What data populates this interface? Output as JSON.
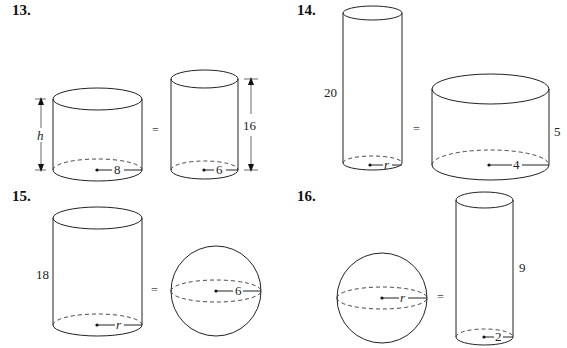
{
  "problems": [
    {
      "number": "13.",
      "left": {
        "shape": "cylinder",
        "height_label": "h",
        "radius_label": "8"
      },
      "equals": "=",
      "right": {
        "shape": "cylinder",
        "height_label": "16",
        "radius_label": "6"
      }
    },
    {
      "number": "14.",
      "left": {
        "shape": "cylinder",
        "height_label": "20",
        "radius_label": "r"
      },
      "equals": "=",
      "right": {
        "shape": "cylinder",
        "height_label": "5",
        "radius_label": "4"
      }
    },
    {
      "number": "15.",
      "left": {
        "shape": "cylinder",
        "height_label": "18",
        "radius_label": "r"
      },
      "equals": "=",
      "right": {
        "shape": "sphere",
        "radius_label": "6"
      }
    },
    {
      "number": "16.",
      "left": {
        "shape": "sphere",
        "radius_label": "r"
      },
      "equals": "=",
      "right": {
        "shape": "cylinder",
        "height_label": "9",
        "radius_label": "2"
      }
    }
  ]
}
